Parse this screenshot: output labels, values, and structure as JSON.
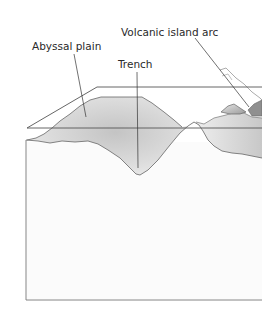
{
  "diagram": {
    "type": "ocean-floor-cross-section",
    "labels": {
      "volcanic_island_arc": "Volcanic island arc",
      "abyssal_plain": "Abyssal plain",
      "trench": "Trench"
    },
    "colors": {
      "line": "#555555",
      "fill_light": "#ececec",
      "fill_dark": "#bdbdbd",
      "background": "#ffffff"
    }
  }
}
